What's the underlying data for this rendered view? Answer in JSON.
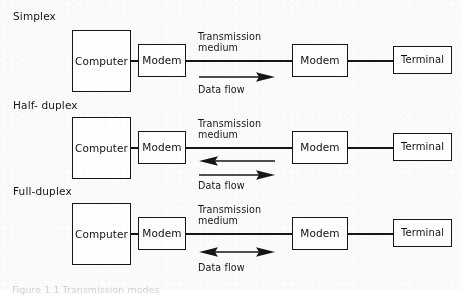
{
  "figure": {
    "caption": "Figure 1.1  Transmission modes",
    "ink_color": "#15161a",
    "paper_color": "#fbfbfa"
  },
  "labels": {
    "computer": "Computer",
    "modem": "Modem",
    "terminal": "Terminal",
    "transmission_medium_line1": "Transmission",
    "transmission_medium_line2": "medium",
    "data_flow": "Data flow"
  },
  "rows": [
    {
      "id": "simplex",
      "mode_label": "Simplex",
      "arrows": [
        {
          "direction": "right",
          "heads": 1
        }
      ]
    },
    {
      "id": "half-duplex",
      "mode_label": "Half- duplex",
      "arrows": [
        {
          "direction": "left",
          "heads": 1
        },
        {
          "direction": "right",
          "heads": 1
        }
      ]
    },
    {
      "id": "full-duplex",
      "mode_label": "Full-duplex",
      "arrows": [
        {
          "direction": "both",
          "heads": 2
        }
      ]
    }
  ]
}
